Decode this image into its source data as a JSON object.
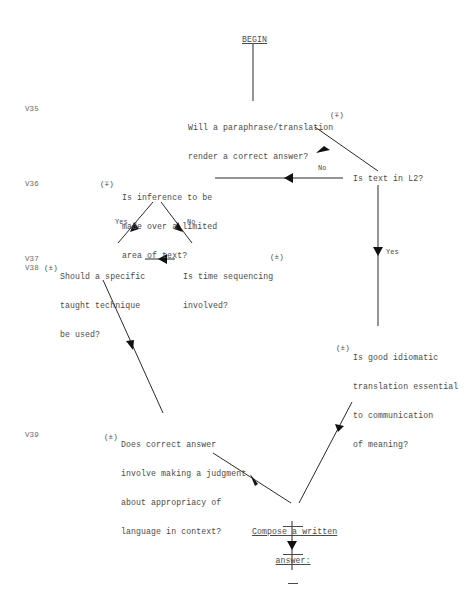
{
  "diagram": {
    "start_node": "BEGIN",
    "end_node_lines": [
      "Compose a written",
      "answer:"
    ],
    "variable_labels": {
      "v35": "V35",
      "v36": "V36",
      "v37": "V37",
      "v38": "V38",
      "v39": "V39"
    },
    "sign_markers": {
      "q_paraphrase": "(∓)",
      "q_inference": "(∓)",
      "q_time": "(±)",
      "q_technique": "(±)",
      "q_idiomatic": "(±)",
      "q_judgment": "(±)"
    },
    "nodes": {
      "q_paraphrase": [
        "Will a paraphrase/translation",
        "render a correct answer?"
      ],
      "q_l2": [
        "Is text in L2?"
      ],
      "q_inference": [
        "Is inference to be",
        "made over a limited",
        "area of text?"
      ],
      "q_technique": [
        "Should a specific",
        "taught technique",
        "be used?"
      ],
      "q_time": [
        "Is time sequencing",
        "involved?"
      ],
      "q_idiomatic": [
        "Is good idiomatic",
        "translation essential",
        "to communication",
        "of meaning?"
      ],
      "q_judgment": [
        "Does correct answer",
        "involve making a judgment",
        "about appropriacy of",
        "language in context?"
      ]
    },
    "edge_labels": {
      "l2_no": "No",
      "l2_yes": "Yes",
      "inference_yes": "Yes",
      "inference_no": "No"
    }
  }
}
